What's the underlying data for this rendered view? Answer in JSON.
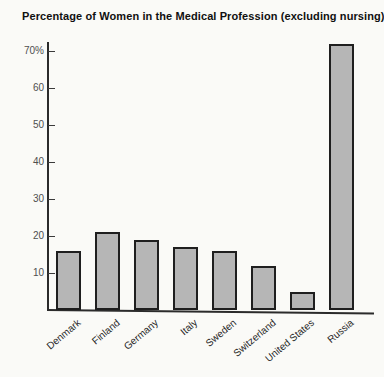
{
  "title": "Percentage of Women in the Medical Profession (excluding nursing)",
  "colors": {
    "background": "#fafaf7",
    "bar_fill": "#b6b6b6",
    "bar_border": "#1f1f1f",
    "axis": "#2b2b2b",
    "tick_label": "#4f4f4f",
    "category_label": "#262626",
    "title_text": "#101010"
  },
  "chart_data": {
    "type": "bar",
    "title": "Percentage of Women in the Medical Profession (excluding nursing)",
    "categories": [
      "Denmark",
      "Finland",
      "Germany",
      "Italy",
      "Sweden",
      "Switzerland",
      "United States",
      "Russia"
    ],
    "values": [
      16,
      21,
      19,
      17,
      16,
      12,
      5,
      72
    ],
    "xlabel": "",
    "ylabel": "",
    "ylim": [
      0,
      75
    ],
    "yticks": [
      10,
      20,
      30,
      40,
      50,
      60,
      70
    ],
    "ytick_labels": [
      "10",
      "20",
      "30",
      "40",
      "50",
      "60",
      "70%"
    ],
    "grid": false,
    "legend": null,
    "bar_fill": "#b6b6b6",
    "bar_border": "#1f1f1f"
  }
}
